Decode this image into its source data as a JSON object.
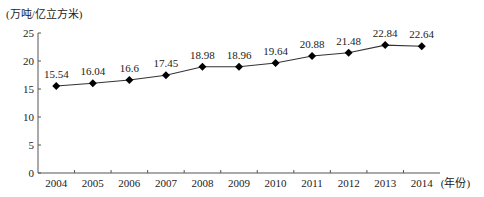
{
  "chart_data": {
    "type": "line",
    "title": "",
    "ylabel": "(万吨/亿立方米)",
    "xlabel": "(年份)",
    "categories": [
      "2004",
      "2005",
      "2006",
      "2007",
      "2008",
      "2009",
      "2010",
      "2011",
      "2012",
      "2013",
      "2014"
    ],
    "values": [
      15.54,
      16.04,
      16.6,
      17.45,
      18.98,
      18.96,
      19.64,
      20.88,
      21.48,
      22.84,
      22.64
    ],
    "data_labels": [
      "15.54",
      "16.04",
      "16.6",
      "17.45",
      "18.98",
      "18.96",
      "19.64",
      "20.88",
      "21.48",
      "22.84",
      "22.64"
    ],
    "ylim": [
      0,
      25
    ],
    "yticks": [
      0,
      5,
      10,
      15,
      20,
      25
    ],
    "grid": false,
    "marker": "diamond",
    "line_color": "#333333",
    "marker_color": "#000000"
  }
}
